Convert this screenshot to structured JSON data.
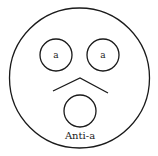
{
  "diagram": {
    "left_circle_label": "a",
    "right_circle_label": "a",
    "bottom_label": "Anti-a",
    "stroke_color": "#1a1a1a",
    "background_color": "#ffffff"
  }
}
